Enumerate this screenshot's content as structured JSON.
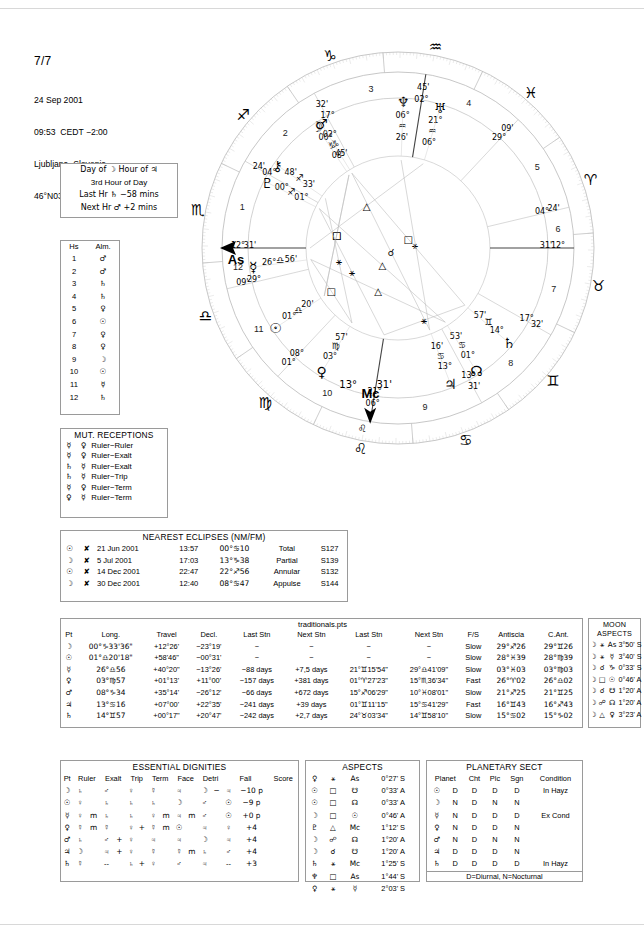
{
  "page": {
    "number": "7/7"
  },
  "birth": {
    "date": "24 Sep 2001",
    "time": "09:53  CEDT −2:00",
    "place": "Ljubljana, Slovenia",
    "coords": "46°N03' 014°E31'"
  },
  "hours": {
    "line1": "Day of ☽  Hour of ♃",
    "line2": "3rd Hour of Day",
    "line3": "Last Hr ♄  −58 mins",
    "line4": "Next Hr ♂  +2 mins"
  },
  "almuten": {
    "header": [
      "Hs",
      "Alm."
    ],
    "rows": [
      [
        "1",
        "♂"
      ],
      [
        "2",
        "♂"
      ],
      [
        "3",
        "♄"
      ],
      [
        "4",
        "♄"
      ],
      [
        "5",
        "♀"
      ],
      [
        "6",
        "☉"
      ],
      [
        "7",
        "♀"
      ],
      [
        "8",
        "♀"
      ],
      [
        "9",
        "☽"
      ],
      [
        "10",
        "☉"
      ],
      [
        "11",
        "☿"
      ],
      [
        "12",
        "♄"
      ]
    ]
  },
  "mutual_receptions": {
    "title": "MUT. RECEPTIONS",
    "rows": [
      [
        "☿",
        "♀",
        "Ruler−Ruler"
      ],
      [
        "☿",
        "♀",
        "Ruler−Exalt"
      ],
      [
        "♄",
        "☿",
        "Ruler−Exalt"
      ],
      [
        "♄",
        "☿",
        "Ruler−Trip"
      ],
      [
        "☿",
        "♀",
        "Ruler−Term"
      ],
      [
        "♀",
        "☿",
        "Ruler−Term"
      ]
    ]
  },
  "eclipses": {
    "title": "NEAREST ECLIPSES (NM/FM)",
    "rows": [
      [
        "☉",
        "✘",
        "21 Jun 2001",
        "13:57",
        "00°♋10",
        "Total",
        "S127"
      ],
      [
        "☽",
        "✘",
        "5 Jul 2001",
        "17:03",
        "13°♑38",
        "Partial",
        "S139"
      ],
      [
        "☉",
        "✘",
        "14 Dec 2001",
        "22:47",
        "22°♐56",
        "Annular",
        "S132"
      ],
      [
        "☽",
        "✘",
        "30 Dec 2001",
        "12:40",
        "08°♋47",
        "Appulse",
        "S144"
      ]
    ]
  },
  "traditionals": {
    "title": "traditionals.pts",
    "headers": [
      "Pt",
      "Long.",
      "Travel",
      "Decl.",
      "Last Stn",
      "Next Stn",
      "Last Stn",
      "Next Stn",
      "F/S",
      "Antiscia",
      "C.Ant."
    ],
    "rows": [
      [
        "☽",
        "00°♑33'36\"",
        "+12°26'",
        "−23°19'",
        "−",
        "−",
        "−",
        "−",
        "Slow",
        "29°♐26",
        "29°♊26"
      ],
      [
        "☉",
        "01°♎20'18\"",
        "+58'46\"",
        "−00°31'",
        "−",
        "−",
        "−",
        "−",
        "Slow",
        "28°♓39",
        "28°♍39"
      ],
      [
        "☿",
        "26°♎56",
        "+40°20\"",
        "−13°26'",
        "−88 days",
        "+7,5 days",
        "21°♊15'54\"",
        "29°♎41'09\"",
        "Slow",
        "03°♓03",
        "03°♍03"
      ],
      [
        "♀",
        "03°♍57",
        "+01°13'",
        "+11°00'",
        "−157 days",
        "+381 days",
        "01°♈27'23\"",
        "15°♏36'34\"",
        "Fast",
        "26°♈02",
        "26°♎02"
      ],
      [
        "♂",
        "08°♑34",
        "+35°14'",
        "−26°12'",
        "−66 days",
        "+672 days",
        "15°♐06'29\"",
        "10°♓08'01\"",
        "Slow",
        "21°♐25",
        "21°♊25"
      ],
      [
        "♃",
        "13°♋16",
        "+07°00'",
        "+22°35'",
        "−241 days",
        "+39 days",
        "01°♊11'15\"",
        "15°♋41'29\"",
        "Fast",
        "16°♊43",
        "16°♐43"
      ],
      [
        "♄",
        "14°♊57",
        "+00°17\"",
        "+20°47'",
        "−242 days",
        "+2,7 days",
        "24°♉03'34\"",
        "14°♊58'10\"",
        "Slow",
        "15°♋02",
        "15°♑02"
      ]
    ]
  },
  "moon_aspects": {
    "title": "MOON ASPECTS",
    "rows": [
      [
        "☽",
        "⚹",
        "As",
        "3°50' S"
      ],
      [
        "☽",
        "⚹",
        "☿",
        "3°40' S"
      ],
      [
        "☽",
        "☌",
        "♑",
        "0°33' S"
      ],
      [
        "☽",
        "□",
        "☉",
        "0°46' A"
      ],
      [
        "☽",
        "☌",
        "☋",
        "1°20' A"
      ],
      [
        "☽",
        "☍",
        "☊",
        "1°20' A"
      ],
      [
        "☽",
        "△",
        "♀",
        "3°23' A"
      ]
    ]
  },
  "dignities": {
    "title": "ESSENTIAL DIGNITIES",
    "headers": [
      "Pt",
      "Ruler",
      "Exalt",
      "Trip",
      "Term",
      "Face",
      "Detri",
      "Fall",
      "Score"
    ],
    "rows": [
      [
        "☽",
        "♄",
        "",
        "♂",
        "",
        "♀",
        "",
        "☿",
        "",
        "♃",
        "",
        "☽",
        "−",
        "♃",
        "−10 p"
      ],
      [
        "☉",
        "♀",
        "",
        "♄",
        "",
        "♄",
        "",
        "♄",
        "",
        "☽",
        "",
        "♂",
        "",
        "☉",
        "−9 p",
        "dash2"
      ],
      [
        "☿",
        "♀",
        "m",
        "♄",
        "",
        "♄",
        "",
        "♀",
        "m",
        "♃",
        "m",
        "♂",
        "",
        "☉",
        "+0 p"
      ],
      [
        "♀",
        "☿",
        "m",
        "☿",
        "",
        "♀",
        "+",
        "☿",
        "m",
        "☉",
        "",
        "♃",
        "",
        "♀",
        "+4"
      ],
      [
        "♂",
        "♄",
        "",
        "♂",
        "+",
        "♀",
        "",
        "♃",
        "",
        "♃",
        "",
        "☽",
        "",
        "♃",
        "+4"
      ],
      [
        "♃",
        "☽",
        "",
        "♃",
        "+",
        "♀",
        "",
        "☿",
        "",
        "☿",
        "m",
        "♄",
        "",
        "♂",
        "+4"
      ],
      [
        "♄",
        "☿",
        "",
        "--",
        "",
        "♄",
        "+",
        "♀",
        "",
        "♂",
        "",
        "♃",
        "",
        "--",
        "+3"
      ]
    ]
  },
  "aspects": {
    "title": "ASPECTS",
    "rows": [
      [
        "♀",
        "⚹",
        "As",
        "0°27' S"
      ],
      [
        "☉",
        "□",
        "☋",
        "0°33' A"
      ],
      [
        "☉",
        "□",
        "☊",
        "0°33' A"
      ],
      [
        "☽",
        "□",
        "☉",
        "0°46' A"
      ],
      [
        "♇",
        "△",
        "Mc",
        "1°12' S"
      ],
      [
        "☽",
        "☍",
        "☊",
        "1°20' A"
      ],
      [
        "☽",
        "☌",
        "☋",
        "1°20' A"
      ],
      [
        "♄",
        "⚹",
        "Mc",
        "1°25' S"
      ],
      [
        "♆",
        "□",
        "As",
        "1°44' S"
      ],
      [
        "♀",
        "⚹",
        "☿",
        "2°03' S"
      ]
    ]
  },
  "sect": {
    "title": "PLANETARY SECT",
    "headers": [
      "Planet",
      "Cht",
      "Plc",
      "Sgn",
      "Condition"
    ],
    "rows": [
      [
        "☉",
        "D",
        "D",
        "D",
        "D",
        "In Hayz"
      ],
      [
        "☽",
        "N",
        "D",
        "N",
        "N",
        ""
      ],
      [
        "☿",
        "N",
        "D",
        "D",
        "D",
        "Ex Cond"
      ],
      [
        "♀",
        "N",
        "D",
        "D",
        "N",
        ""
      ],
      [
        "♂",
        "N",
        "D",
        "N",
        "N",
        ""
      ],
      [
        "♃",
        "D",
        "D",
        "D",
        "N",
        ""
      ],
      [
        "♄",
        "D",
        "D",
        "D",
        "D",
        "In Hayz"
      ]
    ],
    "footer": "D=Diurnal, N=Nocturnal"
  },
  "wheel": {
    "angles": {
      "asc_deg": "04°",
      "asc_min": "24'",
      "asc_sign": "♏",
      "asc_label": "As",
      "asc_full": "04°♏ 24'",
      "mc_deg": "13°",
      "mc_min": "31'",
      "mc_label": "Mc",
      "mc_sign": "♌",
      "dsc_deg": "04°",
      "dsc_min": "24'",
      "ic_deg": "13°",
      "ic_min": "31'"
    },
    "cusps": [
      {
        "house": "11",
        "deg": "31'",
        "sign": "♐",
        "val": "12°"
      },
      {
        "house": "12",
        "deg": "04°",
        "sign": "♏",
        "val": "24'"
      },
      {
        "house": "10",
        "deg": "17°",
        "sign": "♍",
        "val": "32'"
      },
      {
        "house": "9",
        "deg": "02°",
        "sign": "♋",
        "val": "45'"
      },
      {
        "house": "8",
        "deg": "29°",
        "sign": "♊",
        "val": "09'"
      },
      {
        "house": "7",
        "deg": "04°",
        "sign": "♉",
        "val": "24'"
      },
      {
        "house": "6",
        "deg": "31'",
        "sign": "♈",
        "val": "12°"
      },
      {
        "house": "5",
        "deg": "17°",
        "sign": "♓",
        "val": "32'"
      },
      {
        "house": "4",
        "deg": "13°",
        "sign": "♒",
        "val": "31'"
      },
      {
        "house": "3",
        "deg": "21°",
        "sign": "♑",
        "val": "06°"
      },
      {
        "house": "2",
        "deg": "08°",
        "sign": "♐",
        "val": "01°"
      },
      {
        "house": "1",
        "deg": "29°",
        "sign": "♏",
        "val": "09'"
      }
    ],
    "planets": [
      {
        "name": "venus",
        "glyph": "♀",
        "deg": "03°",
        "sign": "♍",
        "min": "57'"
      },
      {
        "name": "sun",
        "glyph": "☉",
        "deg": "01°",
        "sign": "♎",
        "min": "20'"
      },
      {
        "name": "mercury",
        "glyph": "☿",
        "deg": "26°",
        "sign": "♎",
        "min": "56'"
      },
      {
        "name": "jupiter",
        "glyph": "♃",
        "deg": "13°",
        "sign": "♋",
        "min": "16'"
      },
      {
        "name": "node",
        "glyph": "☊",
        "deg": "01°",
        "sign": "♋",
        "min": "53'"
      },
      {
        "name": "saturn",
        "glyph": "♄",
        "deg": "14°",
        "sign": "♊",
        "min": "57'"
      },
      {
        "name": "pluto",
        "glyph": "♇",
        "deg": "00°",
        "sign": "♐",
        "min": "01°"
      },
      {
        "name": "moon",
        "glyph": "☽",
        "deg": "00°",
        "sign": "♑",
        "min": "08'"
      },
      {
        "name": "mars",
        "glyph": "♂",
        "deg": "02°",
        "sign": "♑",
        "min": "45'"
      },
      {
        "name": "uranus",
        "glyph": "♅",
        "deg": "21°",
        "sign": "♒",
        "min": "06°"
      },
      {
        "name": "neptune",
        "glyph": "♆",
        "deg": "06°",
        "sign": "♒",
        "min": "26'"
      },
      {
        "name": "chiron",
        "glyph": "⚷",
        "deg": "48'",
        "sign": "♐",
        "min": "33'"
      }
    ],
    "house_numbers": [
      "1",
      "2",
      "3",
      "4",
      "5",
      "6",
      "7",
      "8",
      "9",
      "10",
      "11",
      "12"
    ]
  }
}
